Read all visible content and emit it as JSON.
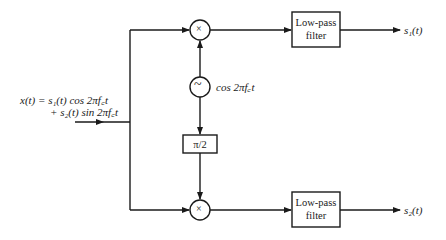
{
  "diagram": {
    "input": {
      "label_line1": "x(t) = s₁(t) cos 2πf꜀t",
      "label_line2": "+ s₂(t) sin 2πf꜀t"
    },
    "top_mixer": {
      "symbol": "×"
    },
    "bottom_mixer": {
      "symbol": "×"
    },
    "oscillator": {
      "symbol": "~",
      "label": "cos 2πf꜀t"
    },
    "phase_shifter": {
      "label": "π/2"
    },
    "top_filter": {
      "line1": "Low-pass",
      "line2": "filter"
    },
    "bottom_filter": {
      "line1": "Low-pass",
      "line2": "filter"
    },
    "outputs": {
      "top": "s₁(t)",
      "bottom": "s₂(t)"
    }
  }
}
